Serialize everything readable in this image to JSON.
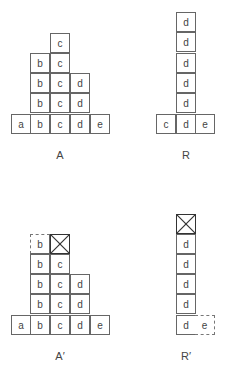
{
  "diagrams": {
    "A": {
      "label": "A",
      "cells": [
        {
          "text": "c",
          "col": 2,
          "row": 0
        },
        {
          "text": "b",
          "col": 1,
          "row": 1
        },
        {
          "text": "c",
          "col": 2,
          "row": 1
        },
        {
          "text": "b",
          "col": 1,
          "row": 2
        },
        {
          "text": "c",
          "col": 2,
          "row": 2
        },
        {
          "text": "d",
          "col": 3,
          "row": 2
        },
        {
          "text": "b",
          "col": 1,
          "row": 3
        },
        {
          "text": "c",
          "col": 2,
          "row": 3
        },
        {
          "text": "d",
          "col": 3,
          "row": 3
        },
        {
          "text": "a",
          "col": 0,
          "row": 4
        },
        {
          "text": "b",
          "col": 1,
          "row": 4
        },
        {
          "text": "c",
          "col": 2,
          "row": 4
        },
        {
          "text": "d",
          "col": 3,
          "row": 4
        },
        {
          "text": "e",
          "col": 4,
          "row": 4
        }
      ]
    },
    "R": {
      "label": "R",
      "cells": [
        {
          "text": "d"
        },
        {
          "text": "d"
        },
        {
          "text": "d"
        },
        {
          "text": "d"
        },
        {
          "text": "d"
        },
        {
          "text": "c"
        },
        {
          "text": "d"
        },
        {
          "text": "e"
        }
      ]
    },
    "A_prime": {
      "label": "A′",
      "cells": [
        {
          "text": "b",
          "style": "dashed"
        },
        {
          "text": "",
          "style": "crossed"
        },
        {
          "text": "b"
        },
        {
          "text": "c"
        },
        {
          "text": "b"
        },
        {
          "text": "c"
        },
        {
          "text": "d"
        },
        {
          "text": "b"
        },
        {
          "text": "c"
        },
        {
          "text": "d"
        },
        {
          "text": "a"
        },
        {
          "text": "b"
        },
        {
          "text": "c"
        },
        {
          "text": "d"
        },
        {
          "text": "e"
        }
      ]
    },
    "R_prime": {
      "label": "R′",
      "cells": [
        {
          "text": "",
          "style": "crossed"
        },
        {
          "text": "d"
        },
        {
          "text": "d"
        },
        {
          "text": "d"
        },
        {
          "text": "d"
        },
        {
          "text": "d"
        },
        {
          "text": "e",
          "style": "dashed"
        }
      ]
    }
  }
}
